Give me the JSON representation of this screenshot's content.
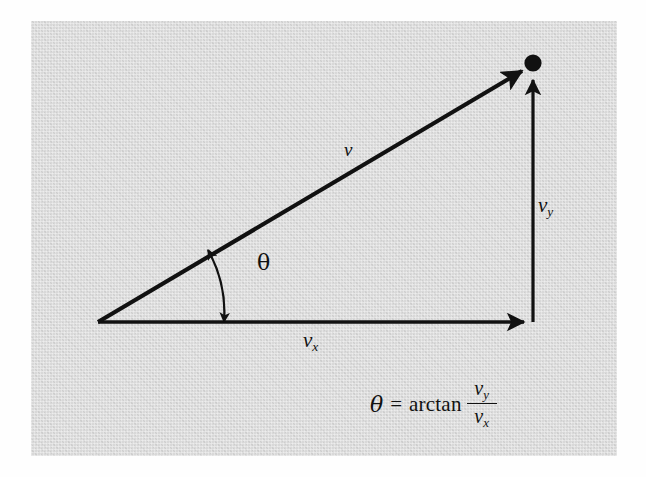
{
  "figure": {
    "background_color": "#d8d8d8",
    "stroke_color": "#111111",
    "labels": {
      "magnitude": "v",
      "vertical_component_base": "v",
      "vertical_component_sub": "y",
      "horizontal_component_base": "v",
      "horizontal_component_sub": "x",
      "angle": "θ"
    },
    "equation": {
      "lhs": "θ",
      "equals": "=",
      "function": "arctan",
      "numerator_base": "v",
      "numerator_sub": "y",
      "denominator_base": "v",
      "denominator_sub": "x"
    },
    "geometry": {
      "origin_x": 98,
      "origin_y": 322,
      "tip_x": 533,
      "tip_y": 64,
      "x_axis_end_x": 533,
      "x_axis_end_y": 322,
      "arc_radius": 128,
      "angle_degrees": 30.7
    }
  }
}
